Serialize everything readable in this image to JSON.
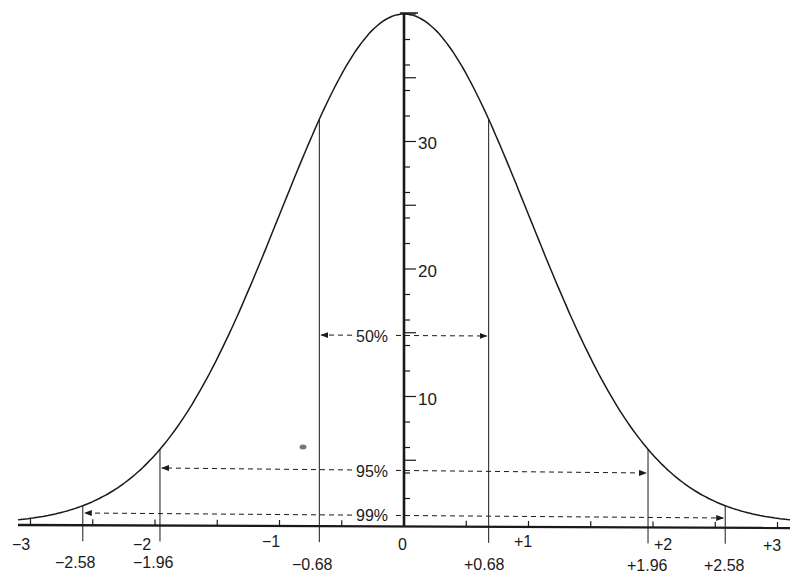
{
  "chart_data": {
    "type": "line",
    "title": "",
    "xlabel": "",
    "ylabel": "",
    "x_range": [
      -3,
      3
    ],
    "y_range": [
      0,
      40
    ],
    "grid": false,
    "x_ticks": [
      {
        "value": -3,
        "label": "−3"
      },
      {
        "value": -2,
        "label": "−2"
      },
      {
        "value": -1,
        "label": "−1"
      },
      {
        "value": 0,
        "label": "0"
      },
      {
        "value": 1,
        "label": "+1"
      },
      {
        "value": 2,
        "label": "+2"
      },
      {
        "value": 3,
        "label": "+3"
      }
    ],
    "x_minor_ticks": [
      -2.5,
      -1.5,
      -0.5,
      0.5,
      1.5,
      2.5
    ],
    "y_ticks": [
      {
        "value": 10,
        "label": "10"
      },
      {
        "value": 20,
        "label": "20"
      },
      {
        "value": 30,
        "label": "30"
      }
    ],
    "y_peak": 40,
    "series": [
      {
        "name": "normal curve",
        "x": [
          -3,
          -2.5,
          -2,
          -1.5,
          -1,
          -0.5,
          0,
          0.5,
          1,
          1.5,
          2,
          2.5,
          3
        ],
        "values": [
          0.44,
          1.75,
          5.4,
          12.95,
          24.2,
          35.2,
          39.9,
          35.2,
          24.2,
          12.95,
          5.4,
          1.75,
          0.44
        ]
      }
    ],
    "markers": [
      {
        "value": -2.58,
        "label": "−2.58"
      },
      {
        "value": -1.96,
        "label": "−1.96"
      },
      {
        "value": -0.68,
        "label": "−0.68"
      },
      {
        "value": 0.68,
        "label": "+0.68"
      },
      {
        "value": 1.96,
        "label": "+1.96"
      },
      {
        "value": 2.58,
        "label": "+2.58"
      }
    ],
    "intervals": [
      {
        "label": "50%",
        "from": -0.68,
        "to": 0.68,
        "y": 14.6
      },
      {
        "label": "95%",
        "from": -1.96,
        "to": 1.96,
        "y": 4.3
      },
      {
        "label": "99%",
        "from": -2.58,
        "to": 2.58,
        "y": 0.6
      }
    ],
    "annotations": [
      "50%",
      "95%",
      "99%"
    ]
  },
  "labels": {
    "x": {
      "m3": "−3",
      "m2": "−2",
      "m1": "−1",
      "zero": "0",
      "p1": "+1",
      "p2": "+2",
      "p3": "+3"
    },
    "markers": {
      "m258": "−2.58",
      "m196": "−1.96",
      "m068": "−0.68",
      "p068": "+0.68",
      "p196": "+1.96",
      "p258": "+2.58"
    },
    "y": {
      "t10": "10",
      "t20": "20",
      "t30": "30"
    },
    "intervals": {
      "p50": "50%",
      "p95": "95%",
      "p99": "99%"
    }
  }
}
